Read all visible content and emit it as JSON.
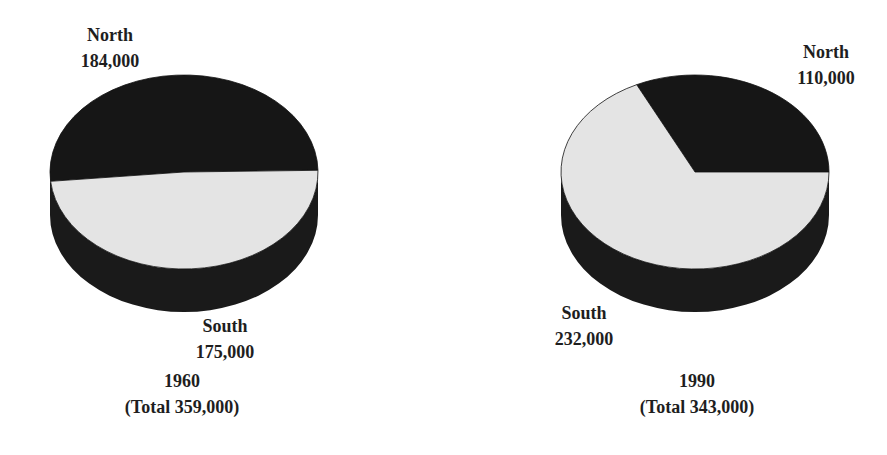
{
  "chart_data": [
    {
      "type": "pie",
      "title": "1960",
      "subtitle": "(Total 359,000)",
      "total": 359000,
      "categories": [
        "North",
        "South"
      ],
      "values": [
        184000,
        175000
      ],
      "value_labels": [
        "184,000",
        "175,000"
      ],
      "colors": [
        "#161616",
        "#e4e4e4"
      ],
      "style": "3d-cylinder",
      "start_angle_deg": 1.0
    },
    {
      "type": "pie",
      "title": "1990",
      "subtitle": "(Total 343,000)",
      "total": 343000,
      "categories": [
        "North",
        "South"
      ],
      "values": [
        110000,
        232000
      ],
      "value_labels": [
        "110,000",
        "232,000"
      ],
      "colors": [
        "#161616",
        "#e4e4e4"
      ],
      "style": "3d-cylinder",
      "start_angle_deg": 0.0
    }
  ],
  "pies": [
    {
      "north": {
        "name": "North",
        "value": "184,000"
      },
      "south": {
        "name": "South",
        "value": "175,000"
      },
      "caption": {
        "year": "1960",
        "total": "(Total 359,000)"
      }
    },
    {
      "north": {
        "name": "North",
        "value": "110,000"
      },
      "south": {
        "name": "South",
        "value": "232,000"
      },
      "caption": {
        "year": "1990",
        "total": "(Total 343,000)"
      }
    }
  ],
  "style": {
    "dark_color": "#161616",
    "light_color": "#e4e4e4",
    "side_color": "#1a1a1a",
    "text_color": "#1e1e1e"
  }
}
